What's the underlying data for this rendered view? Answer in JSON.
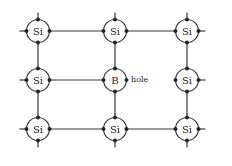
{
  "diagram": {
    "title": "",
    "colors": {
      "line": "#3a3a3a",
      "electron": "#222222",
      "background": "#ffffff"
    },
    "atoms": [
      {
        "id": "a00",
        "label": "Si",
        "row": 0,
        "col": 0
      },
      {
        "id": "a01",
        "label": "Si",
        "row": 0,
        "col": 1
      },
      {
        "id": "a02",
        "label": "Si",
        "row": 0,
        "col": 2
      },
      {
        "id": "a10",
        "label": "Si",
        "row": 1,
        "col": 0
      },
      {
        "id": "a11",
        "label": "B",
        "row": 1,
        "col": 1
      },
      {
        "id": "a12",
        "label": "Si",
        "row": 1,
        "col": 2
      },
      {
        "id": "a20",
        "label": "Si",
        "row": 2,
        "col": 0
      },
      {
        "id": "a21",
        "label": "Si",
        "row": 2,
        "col": 1
      },
      {
        "id": "a22",
        "label": "Si",
        "row": 2,
        "col": 2
      }
    ],
    "missing_bond": {
      "from": "a11",
      "to": "a12"
    },
    "annotation": {
      "label": "hole",
      "near": "a11"
    }
  }
}
